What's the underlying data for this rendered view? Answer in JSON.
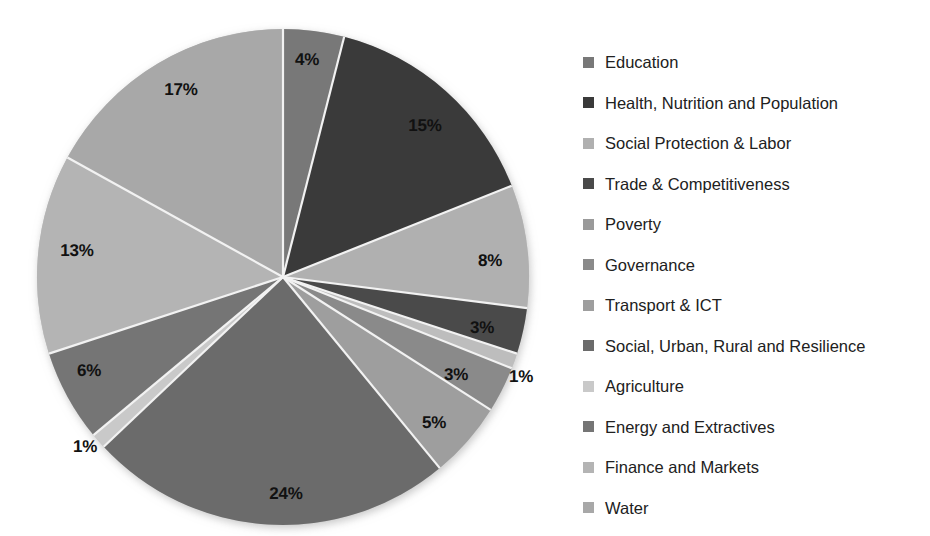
{
  "chart_data": {
    "type": "pie",
    "title": "",
    "subtitle": "",
    "xlabel": "",
    "ylabel": "",
    "grid": false,
    "legend_position": "right",
    "start_angle_deg": 0,
    "direction": "clockwise",
    "value_unit": "percent",
    "labels_show_percent": true,
    "categories": [
      "Education",
      "Health, Nutrition and Population",
      "Social Protection & Labor",
      "Trade & Competitiveness",
      "Poverty",
      "Governance",
      "Transport & ICT",
      "Social, Urban, Rural and Resilience",
      "Agriculture",
      "Energy and Extractives",
      "Finance and Markets",
      "Water"
    ],
    "values": [
      4,
      15,
      8,
      3,
      1,
      3,
      5,
      24,
      1,
      6,
      13,
      17
    ],
    "data_labels": [
      "4%",
      "15%",
      "8%",
      "3%",
      "1%",
      "3%",
      "5%",
      "24%",
      "1%",
      "6%",
      "13%",
      "17%"
    ],
    "colors": [
      "#787878",
      "#3a3a3a",
      "#b0b0b0",
      "#4a4a4a",
      "#bdbdbd",
      "#8a8a8a",
      "#9e9e9e",
      "#6b6b6b",
      "#c9c9c9",
      "#757575",
      "#b4b4b4",
      "#a8a8a8"
    ],
    "slices": [
      {
        "label": "Education",
        "value": 4,
        "data_label": "4%",
        "color": "#787878",
        "label_x": 307,
        "label_y": 60,
        "label_inside": true
      },
      {
        "label": "Health, Nutrition and Population",
        "value": 15,
        "data_label": "15%",
        "color": "#3a3a3a",
        "label_x": 425,
        "label_y": 126,
        "label_inside": true
      },
      {
        "label": "Social Protection & Labor",
        "value": 8,
        "data_label": "8%",
        "color": "#b0b0b0",
        "label_x": 490,
        "label_y": 261,
        "label_inside": true
      },
      {
        "label": "Trade & Competitiveness",
        "value": 3,
        "data_label": "3%",
        "color": "#4a4a4a",
        "label_x": 482,
        "label_y": 328,
        "label_inside": true
      },
      {
        "label": "Poverty",
        "value": 1,
        "data_label": "1%",
        "color": "#bdbdbd",
        "label_x": 521,
        "label_y": 377,
        "label_inside": false
      },
      {
        "label": "Governance",
        "value": 3,
        "data_label": "3%",
        "color": "#8a8a8a",
        "label_x": 456,
        "label_y": 375,
        "label_inside": true
      },
      {
        "label": "Transport & ICT",
        "value": 5,
        "data_label": "5%",
        "color": "#9e9e9e",
        "label_x": 434,
        "label_y": 423,
        "label_inside": true
      },
      {
        "label": "Social, Urban, Rural and Resilience",
        "value": 24,
        "data_label": "24%",
        "color": "#6b6b6b",
        "label_x": 286,
        "label_y": 494,
        "label_inside": true
      },
      {
        "label": "Agriculture",
        "value": 1,
        "data_label": "1%",
        "color": "#c9c9c9",
        "label_x": 85,
        "label_y": 447,
        "label_inside": false
      },
      {
        "label": "Energy and Extractives",
        "value": 6,
        "data_label": "6%",
        "color": "#757575",
        "label_x": 89,
        "label_y": 371,
        "label_inside": true
      },
      {
        "label": "Finance and Markets",
        "value": 13,
        "data_label": "13%",
        "color": "#b4b4b4",
        "label_x": 77,
        "label_y": 251,
        "label_inside": true
      },
      {
        "label": "Water",
        "value": 17,
        "data_label": "17%",
        "color": "#a8a8a8",
        "label_x": 181,
        "label_y": 90,
        "label_inside": true
      }
    ]
  },
  "legend": {
    "items": [
      {
        "label": "Education",
        "color": "#787878"
      },
      {
        "label": "Health, Nutrition and Population",
        "color": "#3a3a3a"
      },
      {
        "label": "Social Protection & Labor",
        "color": "#b0b0b0"
      },
      {
        "label": "Trade & Competitiveness",
        "color": "#4a4a4a"
      },
      {
        "label": "Poverty",
        "color": "#9a9a9a"
      },
      {
        "label": "Governance",
        "color": "#8a8a8a"
      },
      {
        "label": "Transport & ICT",
        "color": "#9e9e9e"
      },
      {
        "label": "Social, Urban, Rural and Resilience",
        "color": "#6b6b6b"
      },
      {
        "label": "Agriculture",
        "color": "#c9c9c9"
      },
      {
        "label": "Energy and Extractives",
        "color": "#757575"
      },
      {
        "label": "Finance and Markets",
        "color": "#b4b4b4"
      },
      {
        "label": "Water",
        "color": "#a8a8a8"
      }
    ]
  },
  "pie_geometry": {
    "center_x": 283,
    "center_y": 277,
    "radius_x": 246,
    "radius_y": 248,
    "separator_color": "#f2f2f2",
    "separator_width": 2.2
  }
}
